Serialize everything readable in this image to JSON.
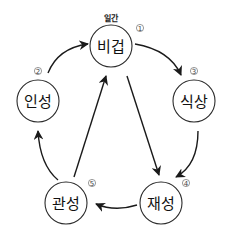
{
  "diagram": {
    "type": "cycle-with-cross-arrows",
    "top_label": "일간",
    "nodes": [
      {
        "id": "bigeop",
        "label": "비겁",
        "number": "①",
        "num_text": "1"
      },
      {
        "id": "inseong",
        "label": "인성",
        "number": "②",
        "num_text": "2"
      },
      {
        "id": "siksang",
        "label": "식상",
        "number": "③",
        "num_text": "3"
      },
      {
        "id": "jaeseong",
        "label": "재성",
        "number": "④",
        "num_text": "4"
      },
      {
        "id": "gwanseong",
        "label": "관성",
        "number": "⑤",
        "num_text": "5"
      }
    ],
    "edges": [
      {
        "from": "인성",
        "to": "비겁",
        "style": "curved"
      },
      {
        "from": "비겁",
        "to": "식상",
        "style": "curved"
      },
      {
        "from": "식상",
        "to": "재성",
        "style": "curved"
      },
      {
        "from": "재성",
        "to": "관성",
        "style": "curved"
      },
      {
        "from": "관성",
        "to": "인성",
        "style": "curved"
      },
      {
        "from": "비겁",
        "to": "재성",
        "style": "straight"
      },
      {
        "from": "관성",
        "to": "비겁",
        "style": "straight"
      }
    ],
    "colors": {
      "stroke": "#1a1a1a",
      "background": "#ffffff"
    }
  }
}
